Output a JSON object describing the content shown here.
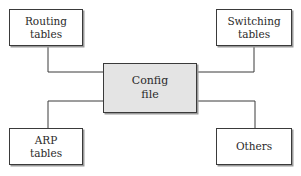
{
  "diagram": {
    "center": {
      "line1": "Config",
      "line2": "file",
      "fill": "#e4e4e4"
    },
    "nodes": [
      {
        "id": "routing",
        "line1": "Routing",
        "line2": "tables"
      },
      {
        "id": "switching",
        "line1": "Switching",
        "line2": "tables"
      },
      {
        "id": "arp",
        "line1": "ARP",
        "line2": "tables"
      },
      {
        "id": "others",
        "line1": "Others",
        "line2": ""
      }
    ],
    "edges": [
      {
        "from": "routing",
        "to": "center"
      },
      {
        "from": "switching",
        "to": "center"
      },
      {
        "from": "arp",
        "to": "center"
      },
      {
        "from": "others",
        "to": "center"
      }
    ]
  }
}
